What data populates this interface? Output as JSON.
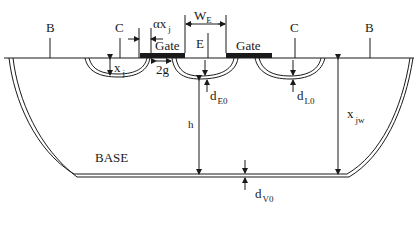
{
  "diagram": {
    "type": "cross-section",
    "colors": {
      "line": "#1a1a1a",
      "background": "#ffffff"
    },
    "terminals": {
      "base_left": "B",
      "base_right": "B",
      "collector_left": "C",
      "collector_right": "C",
      "emitter": "E"
    },
    "gates": {
      "left": "Gate",
      "right": "Gate"
    },
    "dimensions": {
      "alpha_xj": "αx",
      "alpha_xj_sub": "j",
      "width_emitter": "W",
      "width_emitter_sub": "E",
      "xj": "x",
      "xj_sub": "j",
      "gap": "2g",
      "dE0": "d",
      "dE0_sub": "E0",
      "dL0": "d",
      "dL0_sub": "L0",
      "h": "h",
      "xjw": "x",
      "xjw_sub": "jw",
      "dV0": "d",
      "dV0_sub": "V0"
    },
    "region_label": "BASE"
  }
}
